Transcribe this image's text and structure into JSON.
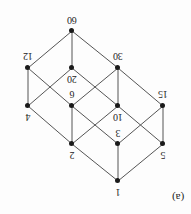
{
  "figure": {
    "caption": "(a)",
    "caption_x": 172,
    "caption_y": 192,
    "orientation_degrees": 180,
    "background_color": "#fdfdfd",
    "node_color": "#1a1a1a",
    "edge_color": "#555555",
    "label_color": "#1c1c1c",
    "width": 191,
    "height": 214
  },
  "chart_data": {
    "type": "diagram",
    "title": "",
    "subtitle": "",
    "xlabel": "",
    "ylabel": "",
    "diagram_kind": "hasse-diagram",
    "nodes": [
      {
        "id": "n1",
        "label": "1",
        "x": 73,
        "y": 33,
        "label_x": 73,
        "label_y": 22
      },
      {
        "id": "n5",
        "label": "5",
        "x": 28,
        "y": 70,
        "label_x": 28,
        "label_y": 59
      },
      {
        "id": "n3",
        "label": "3",
        "x": 73,
        "y": 70,
        "label_x": 73,
        "label_y": 81
      },
      {
        "id": "n2",
        "label": "2",
        "x": 119,
        "y": 70,
        "label_x": 119,
        "label_y": 59
      },
      {
        "id": "n15",
        "label": "15",
        "x": 28,
        "y": 108,
        "label_x": 28,
        "label_y": 120
      },
      {
        "id": "n10",
        "label": "10",
        "x": 73,
        "y": 108,
        "label_x": 73,
        "label_y": 97
      },
      {
        "id": "n6",
        "label": "6",
        "x": 119,
        "y": 108,
        "label_x": 119,
        "label_y": 120
      },
      {
        "id": "n4",
        "label": "4",
        "x": 163,
        "y": 108,
        "label_x": 163,
        "label_y": 97
      },
      {
        "id": "n30",
        "label": "30",
        "x": 73,
        "y": 146,
        "label_x": 73,
        "label_y": 158
      },
      {
        "id": "n20",
        "label": "20",
        "x": 119,
        "y": 146,
        "label_x": 119,
        "label_y": 135
      },
      {
        "id": "n12",
        "label": "12",
        "x": 163,
        "y": 146,
        "label_x": 163,
        "label_y": 158
      },
      {
        "id": "n60",
        "label": "60",
        "x": 119,
        "y": 183,
        "label_x": 119,
        "label_y": 194
      }
    ],
    "edges": [
      {
        "from": "n1",
        "to": "n5"
      },
      {
        "from": "n1",
        "to": "n3"
      },
      {
        "from": "n1",
        "to": "n2"
      },
      {
        "from": "n5",
        "to": "n15"
      },
      {
        "from": "n5",
        "to": "n10"
      },
      {
        "from": "n3",
        "to": "n15"
      },
      {
        "from": "n3",
        "to": "n6"
      },
      {
        "from": "n2",
        "to": "n10"
      },
      {
        "from": "n2",
        "to": "n6"
      },
      {
        "from": "n2",
        "to": "n4"
      },
      {
        "from": "n15",
        "to": "n30"
      },
      {
        "from": "n10",
        "to": "n30"
      },
      {
        "from": "n10",
        "to": "n20"
      },
      {
        "from": "n6",
        "to": "n30"
      },
      {
        "from": "n6",
        "to": "n12"
      },
      {
        "from": "n4",
        "to": "n20"
      },
      {
        "from": "n4",
        "to": "n12"
      },
      {
        "from": "n30",
        "to": "n60"
      },
      {
        "from": "n20",
        "to": "n60"
      },
      {
        "from": "n12",
        "to": "n60"
      }
    ]
  }
}
